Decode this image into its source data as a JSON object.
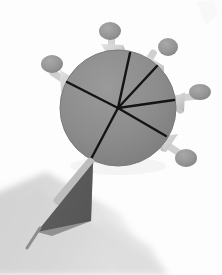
{
  "image": {
    "title": "Radial vector sphere with arrow probes",
    "width": 222,
    "height": 275,
    "background_color": "#fdfdfd",
    "floor_color": "#ffffff"
  },
  "palette": {
    "sphere_fill": "#8a8a8a",
    "sphere_fill_light": "#949494",
    "sphere_edge": "#7b7b7b",
    "radial_line": "#111111",
    "cone_light": "#d8d8d8",
    "cone_mid": "#c2c2c2",
    "cone_shade": "#b0b0b0",
    "ball_fill": "#9a9a9a",
    "ball_shade": "#8a8a8a",
    "stem_color": "#cfcfcf",
    "big_arrow_fill": "#5f5f5f",
    "big_arrow_stem": "#9e9e9e",
    "shadow_color": "#d7d7d7",
    "shadow_soft": "#e6e6e6"
  },
  "sphere": {
    "label": "central-sphere",
    "center_x": 118,
    "center_y": 108,
    "radius": 58
  },
  "radial_vectors": [
    {
      "name": "vector-up",
      "angle_deg": -78,
      "length": 56
    },
    {
      "name": "vector-upper-right",
      "angle_deg": -47,
      "length": 57
    },
    {
      "name": "vector-right",
      "angle_deg": -8,
      "length": 56
    },
    {
      "name": "vector-lower-right",
      "angle_deg": 30,
      "length": 56
    },
    {
      "name": "vector-lower-left",
      "angle_deg": 118,
      "length": 57
    },
    {
      "name": "vector-upper-left",
      "angle_deg": -152,
      "length": 55
    }
  ],
  "probes": [
    {
      "name": "probe-top",
      "tip_x": 113,
      "tip_y": 62,
      "ball_x": 110,
      "ball_y": 31,
      "ball_rx": 11,
      "ball_ry": 9,
      "angle_deg": -95
    },
    {
      "name": "probe-upper-right",
      "tip_x": 150,
      "tip_y": 76,
      "ball_x": 168,
      "ball_y": 47,
      "ball_rx": 10,
      "ball_ry": 9,
      "angle_deg": -58
    },
    {
      "name": "probe-right",
      "tip_x": 166,
      "tip_y": 102,
      "ball_x": 200,
      "ball_y": 92,
      "ball_rx": 11,
      "ball_ry": 8,
      "angle_deg": -16
    },
    {
      "name": "probe-lower-right",
      "tip_x": 158,
      "tip_y": 138,
      "ball_x": 186,
      "ball_y": 158,
      "ball_rx": 11,
      "ball_ry": 9,
      "angle_deg": 35
    },
    {
      "name": "probe-left",
      "tip_x": 80,
      "tip_y": 82,
      "ball_x": 52,
      "ball_y": 64,
      "ball_rx": 11,
      "ball_ry": 9,
      "angle_deg": -147
    }
  ],
  "main_arrow": {
    "name": "main-arrow-lower-left",
    "tip_x": 37,
    "tip_y": 232,
    "tail_x": 92,
    "tail_y": 165,
    "width": 38
  },
  "shadow": {
    "name": "ground-shadow",
    "description": "soft diagonal cast shadow from lower-left to right"
  }
}
